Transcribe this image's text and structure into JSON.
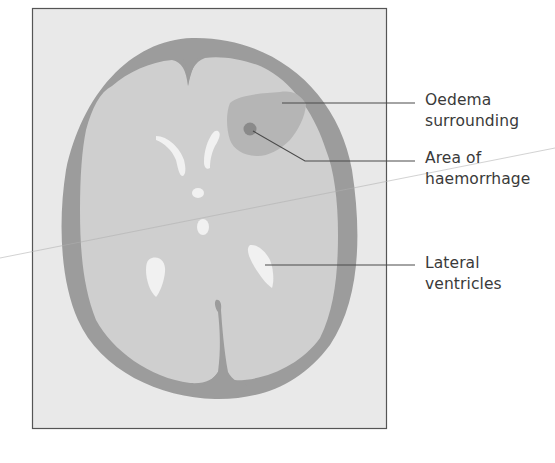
{
  "figure": {
    "type": "diagram",
    "colors": {
      "frame_fill": "#e9e9e9",
      "frame_border": "#555555",
      "skull": "#9c9c9c",
      "brain": "#cfcfcf",
      "oedema": "#b5b5b5",
      "haemorrhage": "#8a8a8a",
      "ventricles": "#f1f1f1",
      "leader_lines": "#4a4a4a",
      "label_text": "#3a3a3a"
    }
  },
  "labels": [
    {
      "id": "oedema",
      "text": "Oedema\nsurrounding"
    },
    {
      "id": "haemorrhage",
      "text": "Area of\nhaemorrhage"
    },
    {
      "id": "ventricles",
      "text": "Lateral\nventricles"
    }
  ]
}
